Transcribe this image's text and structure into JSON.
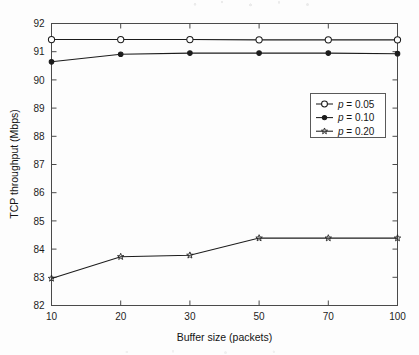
{
  "chart_data": {
    "type": "line",
    "title": "",
    "subtitle": "",
    "xlabel": "Buffer size (packets)",
    "ylabel": "TCP throughput (Mbps)",
    "categories": [
      "10",
      "20",
      "30",
      "50",
      "70",
      "100"
    ],
    "x": [
      10,
      20,
      30,
      50,
      70,
      100
    ],
    "x_scale": "categorical-even-spacing",
    "ylim": [
      82,
      92
    ],
    "xtick_labels": [
      "10",
      "20",
      "30",
      "50",
      "70",
      "100"
    ],
    "ytick_labels": [
      "82",
      "83",
      "84",
      "85",
      "86",
      "87",
      "88",
      "89",
      "90",
      "91",
      "92"
    ],
    "ytick_values": [
      82,
      83,
      84,
      85,
      86,
      87,
      88,
      89,
      90,
      91,
      92
    ],
    "grid": false,
    "legend_position": "center-right",
    "series": [
      {
        "name": "p = 0.05",
        "marker": "open-circle",
        "color": "#1c1c1c",
        "values": [
          91.43,
          91.43,
          91.43,
          91.42,
          91.42,
          91.42
        ]
      },
      {
        "name": "p = 0.10",
        "marker": "filled-circle",
        "color": "#1c1c1c",
        "values": [
          90.64,
          90.91,
          90.95,
          90.95,
          90.95,
          90.93
        ]
      },
      {
        "name": "p = 0.20",
        "marker": "star",
        "color": "#1c1c1c",
        "values": [
          82.96,
          83.73,
          83.78,
          84.39,
          84.39,
          84.39
        ]
      }
    ]
  },
  "axes": {
    "y_label": "TCP throughput (Mbps)",
    "x_label": "Buffer size (packets)",
    "y_ticks": [
      "92",
      "91",
      "90",
      "89",
      "88",
      "87",
      "86",
      "85",
      "84",
      "83",
      "82"
    ],
    "x_ticks": [
      "10",
      "20",
      "30",
      "50",
      "70",
      "100"
    ]
  },
  "legend": {
    "entries": [
      {
        "symbol_prefix": "p",
        "equals": " = ",
        "value": "0.05",
        "full": "p = 0.05",
        "marker": "open-circle"
      },
      {
        "symbol_prefix": "p",
        "equals": " = ",
        "value": "0.10",
        "full": "p = 0.10",
        "marker": "filled-circle"
      },
      {
        "symbol_prefix": "p",
        "equals": " = ",
        "value": "0.20",
        "full": "p = 0.20",
        "marker": "star"
      }
    ]
  },
  "style": {
    "background": "#fdfdfd",
    "axis_color": "#4a4a4a",
    "line_color": "#1c1c1c",
    "legend_border": "#5a5a5a"
  }
}
